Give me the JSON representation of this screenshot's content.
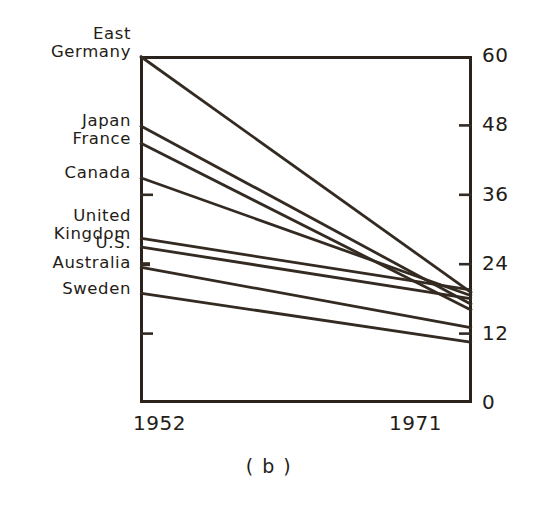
{
  "figure": {
    "caption": "( b )"
  },
  "chart_data": {
    "type": "line",
    "subtype": "slopegraph",
    "title": "",
    "xlabel": "",
    "ylabel": "",
    "x": [
      "1952",
      "1971"
    ],
    "xlim": [
      "1952",
      "1971"
    ],
    "ylim": [
      0,
      60
    ],
    "yticks": [
      60,
      48,
      36,
      24,
      12,
      0
    ],
    "ytick_labels": [
      "60",
      "48",
      "36",
      "24",
      "12",
      "0"
    ],
    "grid": false,
    "legend": "none",
    "legend_position": "left-axis-labels",
    "series": [
      {
        "name": "East Germany",
        "label": "East\nGermany",
        "values": [
          60.0,
          19.0
        ]
      },
      {
        "name": "Japan",
        "label": "Japan",
        "values": [
          48.0,
          17.0
        ]
      },
      {
        "name": "France",
        "label": "France",
        "values": [
          45.0,
          16.0
        ]
      },
      {
        "name": "Canada",
        "label": "Canada",
        "values": [
          39.0,
          18.5
        ]
      },
      {
        "name": "United Kingdom",
        "label": "United\nKingdom",
        "values": [
          28.5,
          19.5
        ]
      },
      {
        "name": "U.S.",
        "label": "U.S.",
        "values": [
          27.0,
          18.0
        ]
      },
      {
        "name": "Australia",
        "label": "Australia",
        "values": [
          23.5,
          13.0
        ]
      },
      {
        "name": "Sweden",
        "label": "Sweden",
        "values": [
          19.0,
          10.5
        ]
      }
    ]
  },
  "style": {
    "ink": "#2b221b",
    "line_color": "#332a22",
    "background": "#ffffff"
  }
}
